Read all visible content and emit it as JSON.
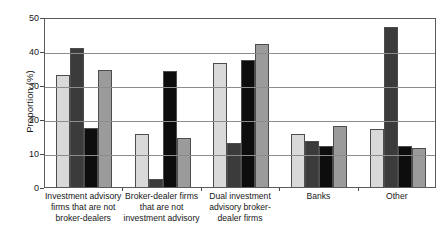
{
  "chart_data": {
    "type": "bar",
    "title": "",
    "subtitle": "",
    "xlabel": "",
    "ylabel": "Proportion (%)",
    "ylim": [
      0,
      50
    ],
    "yticks": [
      0,
      10,
      20,
      30,
      40,
      50
    ],
    "ytick_labels": [
      "0",
      "10",
      "20",
      "30",
      "40",
      "50"
    ],
    "grid": true,
    "grid_axis": "y",
    "legend": false,
    "legend_position": "none",
    "orientation": "vertical",
    "categories": [
      "Investment advisory firms that are not broker-dealers",
      "Broker-dealer firms that are not investment advisory",
      "Dual investment advisory broker-dealer firms",
      "Banks",
      "Other"
    ],
    "category_label_lines": [
      [
        "Investment advisory",
        "firms that are not",
        "broker-dealers"
      ],
      [
        "Broker-dealer firms",
        "that are not",
        "investment advisory"
      ],
      [
        "Dual investment",
        "advisory broker-",
        "dealer firms"
      ],
      [
        "Banks"
      ],
      [
        "Other"
      ]
    ],
    "series": [
      {
        "name": "series-1",
        "color": "#d9d9d9",
        "values": [
          33.0,
          15.5,
          36.5,
          15.5,
          17.0
        ]
      },
      {
        "name": "series-2",
        "color": "#3b3b3b",
        "values": [
          41.0,
          2.5,
          13.0,
          13.5,
          47.0
        ]
      },
      {
        "name": "series-3",
        "color": "#0d0d0d",
        "values": [
          17.5,
          34.0,
          37.5,
          12.0,
          12.0
        ]
      },
      {
        "name": "series-4",
        "color": "#9b9b9b",
        "values": [
          34.5,
          14.5,
          42.0,
          18.0,
          11.5
        ]
      }
    ]
  },
  "axes": {
    "y_title": "Proportion (%)"
  }
}
